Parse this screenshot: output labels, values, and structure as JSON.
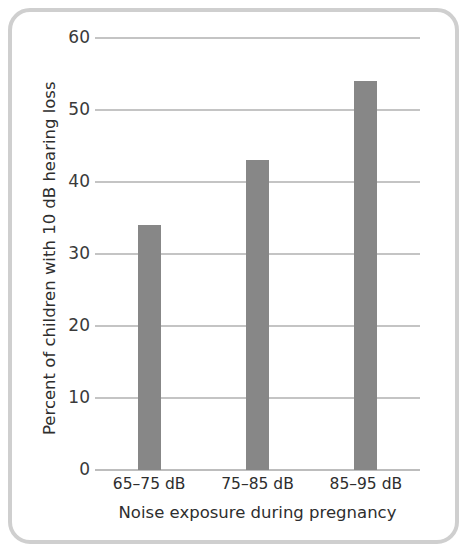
{
  "chart_data": {
    "type": "bar",
    "title": "",
    "subtitle": "",
    "categories": [
      "65–75 dB",
      "75–85 dB",
      "85–95 dB"
    ],
    "values": [
      34,
      43,
      54
    ],
    "xlabel": "Noise exposure during pregnancy",
    "ylabel": "Percent of children with 10 dB hearing loss",
    "ylim": [
      0,
      60
    ],
    "yticks": [
      "0",
      "10",
      "20",
      "30",
      "40",
      "50",
      "60"
    ],
    "ytick_values": [
      0,
      10,
      20,
      30,
      40,
      50,
      60
    ],
    "grid": "horizontal",
    "legend": "none",
    "bar_color": "#878787",
    "gridline_color": "#c4c4c4",
    "text_color": "#2e2e2e",
    "frame_color": "#cfcfcf",
    "background_color": "#ffffff"
  }
}
